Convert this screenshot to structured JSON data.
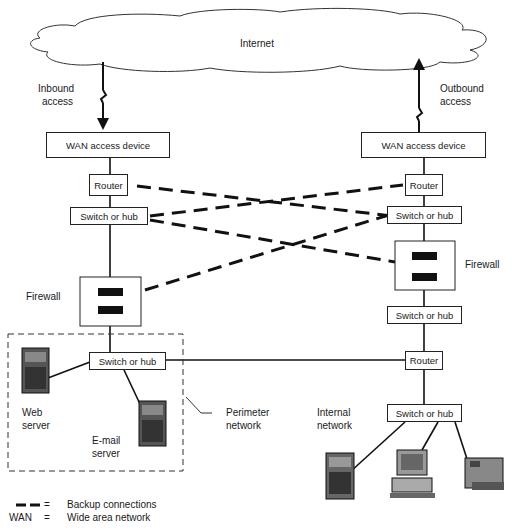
{
  "cloud": {
    "label": "Internet"
  },
  "access": {
    "inbound": {
      "line1": "Inbound",
      "line2": "access"
    },
    "outbound": {
      "line1": "Outbound",
      "line2": "access"
    }
  },
  "left_stack": {
    "wan": "WAN access device",
    "router": "Router",
    "switch1": "Switch or hub",
    "firewall_label": "Firewall",
    "switch2": "Switch or hub"
  },
  "right_stack": {
    "wan": "WAN access device",
    "router1": "Router",
    "switch1": "Switch or hub",
    "firewall_label": "Firewall",
    "switch2": "Switch or hub",
    "router2": "Router",
    "switch3": "Switch or hub"
  },
  "perimeter": {
    "web_server": {
      "line1": "Web",
      "line2": "server"
    },
    "email_server": {
      "line1": "E-mail",
      "line2": "server"
    },
    "label": {
      "line1": "Perimeter",
      "line2": "network"
    }
  },
  "internal": {
    "label": {
      "line1": "Internal",
      "line2": "network"
    }
  },
  "legend": {
    "backup": {
      "symbol": "= ",
      "text": "Backup connections"
    },
    "wan": {
      "abbr": "WAN",
      "eq": "=",
      "text": "Wide area network"
    }
  }
}
